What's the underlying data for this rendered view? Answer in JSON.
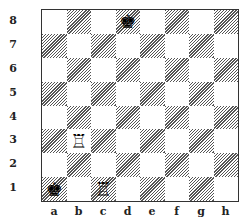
{
  "board": {
    "files": [
      "a",
      "b",
      "c",
      "d",
      "e",
      "f",
      "g",
      "h"
    ],
    "ranks": [
      "8",
      "7",
      "6",
      "5",
      "4",
      "3",
      "2",
      "1"
    ],
    "orientation": "white-bottom",
    "light_color": "#ffffff",
    "dark_style": "hatched",
    "pieces": [
      {
        "square": "d8",
        "piece": "king",
        "color": "black",
        "glyph": "♚"
      },
      {
        "square": "b3",
        "piece": "rook",
        "color": "white",
        "glyph": "♖"
      },
      {
        "square": "a1",
        "piece": "king",
        "color": "black",
        "glyph": "♚"
      },
      {
        "square": "c1",
        "piece": "rook",
        "color": "white",
        "glyph": "♖"
      }
    ]
  }
}
